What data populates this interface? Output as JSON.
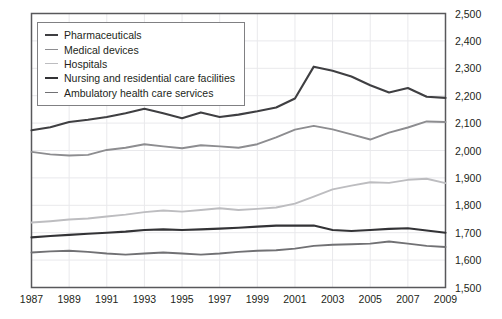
{
  "chart_data": {
    "type": "line",
    "title": "",
    "xlabel": "",
    "ylabel": "",
    "grid": true,
    "legend_position": "top-left",
    "xlim": [
      1987,
      2009
    ],
    "ylim": [
      1500,
      2500
    ],
    "y_ticks": [
      "2,500",
      "2,400",
      "2,300",
      "2,200",
      "2,100",
      "2,000",
      "1,900",
      "1,800",
      "1,700",
      "1,600",
      "1,500"
    ],
    "y_tick_values": [
      2500,
      2400,
      2300,
      2200,
      2100,
      2000,
      1900,
      1800,
      1700,
      1600,
      1500
    ],
    "x_ticks": [
      "1987",
      "1989",
      "1991",
      "1993",
      "1995",
      "1997",
      "1999",
      "2001",
      "2003",
      "2005",
      "2007",
      "2009"
    ],
    "x_tick_values": [
      1987,
      1989,
      1991,
      1993,
      1995,
      1997,
      1999,
      2001,
      2003,
      2005,
      2007,
      2009
    ],
    "x": [
      1987,
      1988,
      1989,
      1990,
      1991,
      1992,
      1993,
      1994,
      1995,
      1996,
      1997,
      1998,
      1999,
      2000,
      2001,
      2002,
      2003,
      2004,
      2005,
      2006,
      2007,
      2008,
      2009
    ],
    "series": [
      {
        "name": "Pharmaceuticals",
        "color": "#3f3f42",
        "width": 2.1,
        "values": [
          2074,
          2085,
          2104,
          2112,
          2122,
          2136,
          2152,
          2136,
          2118,
          2139,
          2122,
          2131,
          2143,
          2157,
          2190,
          2306,
          2291,
          2270,
          2238,
          2212,
          2228,
          2196,
          2192
        ]
      },
      {
        "name": "Medical devices",
        "color": "#8d8d90",
        "width": 1.9,
        "values": [
          1995,
          1986,
          1982,
          1984,
          2002,
          2010,
          2023,
          2015,
          2008,
          2019,
          2015,
          2010,
          2023,
          2048,
          2076,
          2090,
          2077,
          2059,
          2040,
          2065,
          2084,
          2106,
          2104
        ]
      },
      {
        "name": "Hospitals",
        "color": "#bdbdc0",
        "width": 1.9,
        "values": [
          1737,
          1742,
          1748,
          1752,
          1759,
          1766,
          1775,
          1781,
          1777,
          1783,
          1789,
          1783,
          1787,
          1792,
          1806,
          1832,
          1858,
          1872,
          1884,
          1882,
          1893,
          1897,
          1881
        ]
      },
      {
        "name": "Nursing and residential care facilities",
        "color": "#333336",
        "width": 2.1,
        "values": [
          1683,
          1688,
          1692,
          1696,
          1700,
          1704,
          1710,
          1712,
          1710,
          1712,
          1715,
          1718,
          1722,
          1726,
          1726,
          1726,
          1710,
          1706,
          1710,
          1714,
          1716,
          1708,
          1700
        ]
      },
      {
        "name": "Ambulatory health care services",
        "color": "#717174",
        "width": 1.9,
        "values": [
          1628,
          1632,
          1634,
          1630,
          1624,
          1620,
          1624,
          1628,
          1624,
          1620,
          1624,
          1630,
          1634,
          1636,
          1642,
          1652,
          1656,
          1658,
          1660,
          1668,
          1660,
          1652,
          1648
        ]
      }
    ]
  },
  "legend": {
    "items": [
      {
        "label": "Pharmaceuticals"
      },
      {
        "label": "Medical devices"
      },
      {
        "label": "Hospitals"
      },
      {
        "label": "Nursing and residential care facilities"
      },
      {
        "label": "Ambulatory health care services"
      }
    ]
  },
  "colors": {
    "plot_border": "#58585b",
    "gridline": "#e9e9ec",
    "text": "#231f20",
    "background": "#ffffff"
  }
}
